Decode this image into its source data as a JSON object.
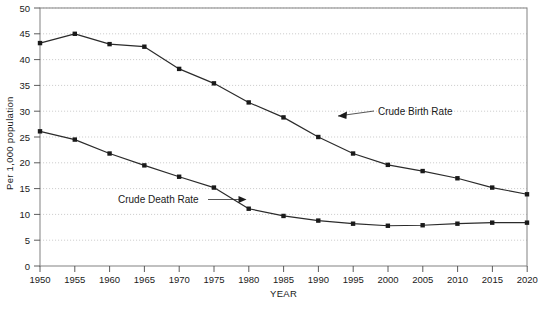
{
  "chart_data": {
    "type": "line",
    "title": "",
    "xlabel": "YEAR",
    "ylabel": "Per 1,000 population",
    "xlim": [
      1950,
      2020
    ],
    "ylim": [
      0,
      50
    ],
    "grid": true,
    "legend_position": "inline-annotations",
    "x": [
      1950,
      1955,
      1960,
      1965,
      1970,
      1975,
      1980,
      1985,
      1990,
      1995,
      2000,
      2005,
      2010,
      2015,
      2020
    ],
    "xtick_labels": [
      "1950",
      "1955",
      "1960",
      "1965",
      "1970",
      "1975",
      "1980",
      "1985",
      "1990",
      "1995",
      "2000",
      "2005",
      "2010",
      "2015",
      "2020"
    ],
    "ytick_labels": [
      "0",
      "5",
      "10",
      "15",
      "20",
      "25",
      "30",
      "35",
      "40",
      "45",
      "50"
    ],
    "ytick_values": [
      0,
      5,
      10,
      15,
      20,
      25,
      30,
      35,
      40,
      45,
      50
    ],
    "series": [
      {
        "name": "Crude Birth Rate",
        "values": [
          43.2,
          45.0,
          43.0,
          42.5,
          38.2,
          35.4,
          31.7,
          28.8,
          25.0,
          21.8,
          19.6,
          18.4,
          17.0,
          15.2,
          13.9
        ]
      },
      {
        "name": "Crude Death Rate",
        "values": [
          26.1,
          24.5,
          21.8,
          19.5,
          17.3,
          15.2,
          11.1,
          9.7,
          8.8,
          8.2,
          7.8,
          7.9,
          8.2,
          8.4,
          8.4
        ]
      }
    ],
    "annotations": [
      {
        "text": "Crude Birth Rate",
        "points_to_series": "Crude Birth Rate"
      },
      {
        "text": "Crude Death Rate",
        "points_to_series": "Crude Death Rate"
      }
    ]
  },
  "caption": {
    "text": ""
  }
}
